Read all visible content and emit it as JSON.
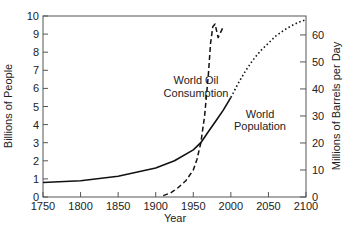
{
  "chart_data": {
    "type": "line",
    "title": "",
    "xlabel": "Year",
    "ylabel": "Billions of People",
    "y2label": "Millions of Barrels per Day",
    "xlim": [
      1750,
      2100
    ],
    "ylim": [
      0,
      10
    ],
    "y2lim": [
      0,
      67
    ],
    "x_ticks": [
      1750,
      1800,
      1850,
      1900,
      1950,
      2000,
      2050,
      2100
    ],
    "y_ticks": [
      0,
      1,
      2,
      3,
      4,
      5,
      6,
      7,
      8,
      9,
      10
    ],
    "y2_ticks": [
      0,
      10,
      20,
      30,
      40,
      50,
      60
    ],
    "grid": false,
    "series": [
      {
        "name": "World Population",
        "axis": "left",
        "style": "solid",
        "x": [
          1750,
          1800,
          1850,
          1900,
          1925,
          1950,
          1960,
          1970,
          1980,
          1990,
          2000
        ],
        "values": [
          0.8,
          0.9,
          1.15,
          1.6,
          2.0,
          2.6,
          3.0,
          3.6,
          4.2,
          4.8,
          5.5
        ]
      },
      {
        "name": "World Population (projected)",
        "axis": "left",
        "style": "dotted",
        "x": [
          2000,
          2010,
          2020,
          2030,
          2040,
          2050,
          2060,
          2070,
          2080,
          2090,
          2100
        ],
        "values": [
          5.5,
          6.3,
          7.0,
          7.6,
          8.1,
          8.5,
          8.9,
          9.2,
          9.45,
          9.65,
          9.8
        ]
      },
      {
        "name": "World Oil Consumption",
        "axis": "right",
        "style": "dashed",
        "x": [
          1910,
          1920,
          1930,
          1940,
          1950,
          1955,
          1960,
          1965,
          1970,
          1973,
          1976,
          1979,
          1983,
          1990
        ],
        "values": [
          0.5,
          1.5,
          3.5,
          6,
          10,
          14,
          20,
          30,
          45,
          57,
          63,
          64,
          59,
          63
        ]
      }
    ],
    "annotations": [
      {
        "text": "World Oil\nConsumption",
        "x": 1930,
        "y": 5.3
      },
      {
        "text": "World\nPopulation",
        "x": 2020,
        "y": 4.4
      }
    ]
  },
  "labels": {
    "ylabel": "Billions of People",
    "y2label": "Millions of Barrels per Day",
    "xlabel": "Year",
    "oil_line1": "World Oil",
    "oil_line2": "Consumption",
    "pop_line1": "World",
    "pop_line2": "Population"
  }
}
